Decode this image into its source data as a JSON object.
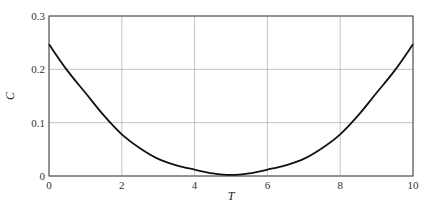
{
  "chart_data": {
    "type": "line",
    "title": "",
    "xlabel": "T",
    "ylabel": "C",
    "xlim": [
      0,
      10
    ],
    "ylim": [
      0,
      0.3
    ],
    "xticks": [
      0,
      2,
      4,
      6,
      8,
      10
    ],
    "yticks": [
      0,
      0.1,
      0.2,
      0.3
    ],
    "xtick_labels": [
      "0",
      "2",
      "4",
      "6",
      "8",
      "10"
    ],
    "ytick_labels": [
      "0",
      "0.1",
      "0.2",
      "0.3"
    ],
    "grid": true,
    "legend": null,
    "series": [
      {
        "name": "C(T)",
        "color": "#111111",
        "x": [
          0,
          0.5,
          1,
          1.5,
          2,
          2.5,
          3,
          3.5,
          4,
          4.5,
          5,
          5.5,
          6,
          6.5,
          7,
          7.5,
          8,
          8.5,
          9,
          9.5,
          10
        ],
        "y": [
          0.247,
          0.198,
          0.156,
          0.114,
          0.078,
          0.052,
          0.032,
          0.02,
          0.012,
          0.005,
          0.002,
          0.005,
          0.012,
          0.02,
          0.032,
          0.052,
          0.078,
          0.114,
          0.156,
          0.198,
          0.247
        ]
      }
    ]
  }
}
